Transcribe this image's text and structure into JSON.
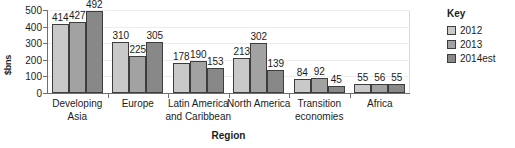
{
  "chart_data": {
    "type": "bar",
    "title": "",
    "subtitle": "",
    "xlabel": "Region",
    "ylabel": "$bns",
    "ylim": [
      0,
      500
    ],
    "yticks": [
      0,
      100,
      200,
      300,
      400,
      500
    ],
    "grid": true,
    "legend_position": "right",
    "legend_title": "Key",
    "categories": [
      "Developing Asia",
      "Europe",
      "Latin America and Caribbean",
      "North America",
      "Transition economies",
      "Africa"
    ],
    "category_lines": [
      [
        "Developing",
        "Asia"
      ],
      [
        "Europe"
      ],
      [
        "Latin America",
        "and Caribbean"
      ],
      [
        "North America"
      ],
      [
        "Transition",
        "economies"
      ],
      [
        "Africa"
      ]
    ],
    "series": [
      {
        "name": "2012",
        "color": "#c9c9c9",
        "values": [
          414,
          310,
          178,
          213,
          84,
          55
        ]
      },
      {
        "name": "2013",
        "color": "#a2a2a2",
        "values": [
          427,
          225,
          190,
          302,
          92,
          56
        ]
      },
      {
        "name": "2014est",
        "color": "#888888",
        "values": [
          492,
          305,
          153,
          139,
          45,
          55
        ]
      }
    ]
  },
  "axis_colors": {
    "axis_line": "#6f6f6f",
    "gridline": "#ededed",
    "bar_outline": "#3d3d3d",
    "text": "#1b1b1b"
  }
}
